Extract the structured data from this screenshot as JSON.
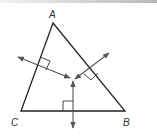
{
  "diagram": {
    "vertices": {
      "A": {
        "label": "A",
        "x": 53,
        "y": 23
      },
      "B": {
        "label": "B",
        "x": 125,
        "y": 111
      },
      "C": {
        "label": "C",
        "x": 21,
        "y": 111
      }
    },
    "labels": {
      "A": "A",
      "B": "B",
      "C": "C"
    },
    "colors": {
      "line": "#222222",
      "arrow": "#555555",
      "text": "#333333"
    }
  }
}
